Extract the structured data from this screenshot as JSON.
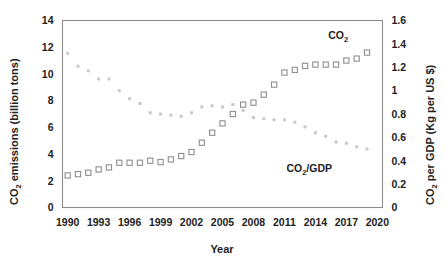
{
  "chart_data": {
    "type": "scatter",
    "title": "",
    "xlabel": "Year",
    "ylabel": "CO2 emissions (billion tons)",
    "y2label": "CO2 per GDP (Kg per US $)",
    "grid": false,
    "legend_position": "inline-annotation",
    "xlim": [
      1989.5,
      2020.5
    ],
    "ylim": [
      0,
      14
    ],
    "y2lim": [
      0,
      1.6
    ],
    "xticks": [
      1990,
      1993,
      1996,
      1999,
      2002,
      2005,
      2008,
      2011,
      2014,
      2017,
      2020
    ],
    "yticks": [
      0,
      2,
      4,
      6,
      8,
      10,
      12,
      14
    ],
    "y2ticks": [
      0,
      0.2,
      0.4,
      0.6,
      0.8,
      1,
      1.2,
      1.4,
      1.6
    ],
    "x": [
      1990,
      1991,
      1992,
      1993,
      1994,
      1995,
      1996,
      1997,
      1998,
      1999,
      2000,
      2001,
      2002,
      2003,
      2004,
      2005,
      2006,
      2007,
      2008,
      2009,
      2010,
      2011,
      2012,
      2013,
      2014,
      2015,
      2016,
      2017,
      2018,
      2019
    ],
    "series": [
      {
        "name": "CO2",
        "axis": "left",
        "marker": "open-square",
        "color": "#8e8e8e",
        "values": [
          2.4,
          2.5,
          2.6,
          2.85,
          3.0,
          3.35,
          3.35,
          3.35,
          3.5,
          3.4,
          3.6,
          3.85,
          4.15,
          4.85,
          5.6,
          6.3,
          7.0,
          7.7,
          7.85,
          8.45,
          9.2,
          10.1,
          10.3,
          10.6,
          10.7,
          10.7,
          10.7,
          11.0,
          11.15,
          11.6
        ]
      },
      {
        "name": "CO2/GDP",
        "axis": "right",
        "marker": "dot",
        "color": "#c9c9c9",
        "values": [
          1.32,
          1.21,
          1.17,
          1.1,
          1.1,
          1.0,
          0.93,
          0.89,
          0.81,
          0.8,
          0.79,
          0.78,
          0.81,
          0.86,
          0.87,
          0.86,
          0.88,
          0.83,
          0.77,
          0.76,
          0.75,
          0.75,
          0.73,
          0.69,
          0.64,
          0.61,
          0.56,
          0.55,
          0.52,
          0.5
        ]
      }
    ],
    "annotations": [
      {
        "name": "co2-label",
        "text": "CO2",
        "text_main": "CO",
        "text_sub": "2",
        "x": 2016.2,
        "y_axis": "left",
        "y": 12.6
      },
      {
        "name": "co2-gdp-label",
        "text": "CO2/GDP",
        "text_main": "CO",
        "text_sub": "2",
        "text_tail": "/GDP",
        "x": 2013.4,
        "y_axis": "left",
        "y": 2.65
      }
    ]
  },
  "axes": {
    "x_title": "Year",
    "y_left_main_a": "CO",
    "y_left_sub": "2",
    "y_left_main_b": " emissions (billion tons)",
    "y_right_main_a": "CO",
    "y_right_sub": "2",
    "y_right_main_b": " per GDP (Kg per US $)",
    "x_tick_labels": [
      "1990",
      "1993",
      "1996",
      "1999",
      "2002",
      "2005",
      "2008",
      "2011",
      "2014",
      "2017",
      "2020"
    ],
    "y_left_tick_labels": [
      "0",
      "2",
      "4",
      "6",
      "8",
      "10",
      "12",
      "14"
    ],
    "y_right_tick_labels": [
      "0",
      "0.2",
      "0.4",
      "0.6",
      "0.8",
      "1",
      "1.2",
      "1.4",
      "1.6"
    ]
  },
  "annotations": {
    "co2_main": "CO",
    "co2_sub": "2",
    "co2_gdp_main": "CO",
    "co2_gdp_sub": "2",
    "co2_gdp_tail": "/GDP"
  },
  "colors": {
    "frame": "#8c8c8c",
    "co2_marker": "#8e8e8e",
    "co2_gdp_marker": "#c9c9c9",
    "text": "#222222",
    "background": "#ffffff"
  }
}
